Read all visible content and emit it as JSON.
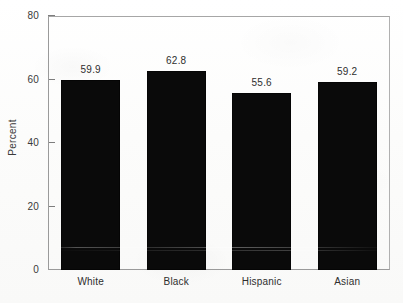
{
  "chart_data": {
    "type": "bar",
    "title": "",
    "xlabel": "",
    "ylabel": "Percent",
    "categories": [
      "White",
      "Black",
      "Hispanic",
      "Asian"
    ],
    "values": [
      59.9,
      62.8,
      55.6,
      59.2
    ],
    "value_labels": [
      "59.9",
      "62.8",
      "55.6",
      "59.2"
    ],
    "ylim": [
      0,
      80
    ],
    "yticks": [
      0,
      20,
      40,
      60,
      80
    ],
    "ytick_labels": [
      "0",
      "20",
      "40",
      "60",
      "80"
    ],
    "grid": false,
    "legend": null,
    "bar_color": "#0a0a0a",
    "axis_color": "#9a9a9a",
    "text_color": "#2e2e2e"
  },
  "axis": {
    "y_title": "Percent"
  },
  "caption": {
    "text": ""
  }
}
